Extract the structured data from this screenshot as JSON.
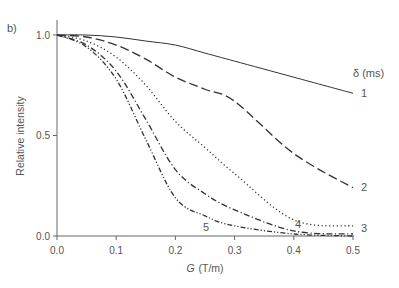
{
  "panel_label": "b)",
  "chart_data": {
    "type": "line",
    "title": "",
    "panel": "b)",
    "xlabel": "G (T/m)",
    "xlabel_italic_part": "G",
    "xlabel_unit": "(T/m)",
    "ylabel": "Relative intensity",
    "xlim": [
      0.0,
      0.5
    ],
    "ylim": [
      0.0,
      1.0
    ],
    "x_ticks": [
      "0.0",
      "0.1",
      "0.2",
      "0.3",
      "0.4",
      "0.5"
    ],
    "y_ticks": [
      "0.0",
      "0.5",
      "1.0"
    ],
    "grid": false,
    "legend_title": "δ (ms)",
    "legend_position": "inline labels at curve ends",
    "x": [
      0.0,
      0.05,
      0.1,
      0.15,
      0.2,
      0.25,
      0.3,
      0.4,
      0.5
    ],
    "series": [
      {
        "name": "1",
        "style": "solid",
        "values": [
          1.0,
          1.0,
          0.99,
          0.97,
          0.95,
          0.91,
          0.87,
          0.79,
          0.71
        ]
      },
      {
        "name": "2",
        "style": "long-dash",
        "values": [
          1.0,
          0.99,
          0.95,
          0.88,
          0.79,
          0.73,
          0.67,
          0.41,
          0.24
        ]
      },
      {
        "name": "3",
        "style": "dotted",
        "values": [
          1.0,
          0.97,
          0.89,
          0.75,
          0.57,
          0.44,
          0.31,
          0.08,
          0.05
        ]
      },
      {
        "name": "4",
        "style": "dash-dot",
        "values": [
          1.0,
          0.95,
          0.82,
          0.58,
          0.33,
          0.21,
          0.13,
          0.025,
          0.01
        ]
      },
      {
        "name": "5",
        "style": "dash-dot-dot",
        "values": [
          1.0,
          0.94,
          0.78,
          0.48,
          0.19,
          0.1,
          0.05,
          0.01,
          0.0
        ]
      }
    ],
    "annotations": [
      {
        "text": "δ (ms)",
        "role": "legend-title"
      },
      {
        "text": "1",
        "series": "1"
      },
      {
        "text": "2",
        "series": "2"
      },
      {
        "text": "3",
        "series": "3"
      },
      {
        "text": "4",
        "series": "4"
      },
      {
        "text": "5",
        "series": "5"
      }
    ]
  },
  "style": {
    "axis_color": "#666666",
    "line_color": "#333333",
    "text_color": "#555555"
  }
}
